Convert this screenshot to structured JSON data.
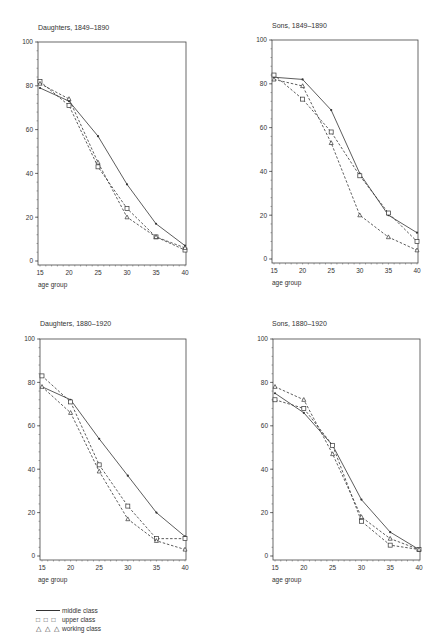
{
  "legend": {
    "middle": {
      "symbol": "——",
      "label": "middle class"
    },
    "upper": {
      "symbol": "□ □ □",
      "label": "upper class"
    },
    "working": {
      "symbol": "△ △ △",
      "label": "working class"
    }
  },
  "chart_data": [
    {
      "type": "line",
      "title": "Daughters, 1849–1890",
      "xlabel": "age group",
      "ylabel": "",
      "x": [
        15,
        20,
        25,
        30,
        35,
        40
      ],
      "ylim": [
        0,
        100
      ],
      "yticks": [
        0,
        20,
        40,
        60,
        80,
        100
      ],
      "grid": false,
      "legend_position": "bottom-left (shared)",
      "series": [
        {
          "name": "middle class",
          "style": "solid",
          "marker": "dot",
          "values": [
            79,
            73,
            57,
            35,
            17,
            7
          ]
        },
        {
          "name": "upper class",
          "style": "dashed",
          "marker": "square",
          "values": [
            82,
            71,
            43,
            24,
            11,
            5
          ]
        },
        {
          "name": "working class",
          "style": "dashed",
          "marker": "triangle",
          "values": [
            81,
            74,
            45,
            20,
            11,
            6
          ]
        }
      ]
    },
    {
      "type": "line",
      "title": "Sons, 1849–1890",
      "xlabel": "age group",
      "ylabel": "",
      "x": [
        15,
        20,
        25,
        30,
        35,
        40
      ],
      "ylim": [
        0,
        100
      ],
      "yticks": [
        0,
        20,
        40,
        60,
        80,
        100
      ],
      "grid": false,
      "legend_position": "bottom-left (shared)",
      "series": [
        {
          "name": "middle class",
          "style": "solid",
          "marker": "dot",
          "values": [
            83,
            82,
            68,
            39,
            20,
            12
          ]
        },
        {
          "name": "upper class",
          "style": "dashed",
          "marker": "square",
          "values": [
            84,
            73,
            58,
            38,
            21,
            8
          ]
        },
        {
          "name": "working class",
          "style": "dashed",
          "marker": "triangle",
          "values": [
            82,
            79,
            53,
            20,
            10,
            4
          ]
        }
      ]
    },
    {
      "type": "line",
      "title": "Daughters, 1880–1920",
      "xlabel": "age group",
      "ylabel": "",
      "x": [
        15,
        20,
        25,
        30,
        35,
        40
      ],
      "ylim": [
        0,
        100
      ],
      "yticks": [
        0,
        20,
        40,
        60,
        80,
        100
      ],
      "grid": false,
      "legend_position": "bottom-left (shared)",
      "series": [
        {
          "name": "middle class",
          "style": "solid",
          "marker": "dot",
          "values": [
            78,
            72,
            54,
            37,
            20,
            9
          ]
        },
        {
          "name": "upper class",
          "style": "dashed",
          "marker": "square",
          "values": [
            83,
            71,
            42,
            23,
            8,
            8
          ]
        },
        {
          "name": "working class",
          "style": "dashed",
          "marker": "triangle",
          "values": [
            78,
            66,
            39,
            17,
            7,
            3
          ]
        }
      ]
    },
    {
      "type": "line",
      "title": "Sons, 1880–1920",
      "xlabel": "age group",
      "ylabel": "",
      "x": [
        15,
        20,
        25,
        30,
        35,
        40
      ],
      "ylim": [
        0,
        100
      ],
      "yticks": [
        0,
        20,
        40,
        60,
        80,
        100
      ],
      "grid": false,
      "legend_position": "bottom-left (shared)",
      "series": [
        {
          "name": "middle class",
          "style": "solid",
          "marker": "dot",
          "values": [
            75,
            66,
            51,
            26,
            11,
            3
          ]
        },
        {
          "name": "upper class",
          "style": "dashed",
          "marker": "square",
          "values": [
            72,
            68,
            51,
            16,
            5,
            3
          ]
        },
        {
          "name": "working class",
          "style": "dashed",
          "marker": "triangle",
          "values": [
            78,
            72,
            47,
            18,
            8,
            3
          ]
        }
      ]
    }
  ]
}
